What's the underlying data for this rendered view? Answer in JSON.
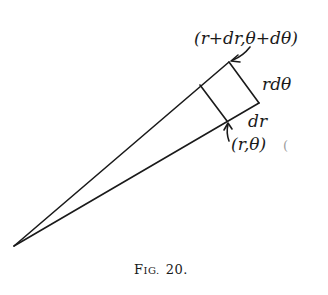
{
  "diagram": {
    "labels": {
      "outer_point": "(r+dr,θ+dθ)",
      "arc_length": "rdθ",
      "radial_length": "dr",
      "inner_point": "(r,θ)",
      "stray_mark": "("
    },
    "caption": {
      "first_letter": "F",
      "rest": "IG.",
      "number": "20."
    },
    "geometry": {
      "apex": [
        14,
        246
      ],
      "upper_ray_end": [
        229,
        62
      ],
      "lower_ray_end": [
        259,
        103
      ],
      "inner_upper_corner": [
        200,
        85
      ],
      "inner_lower_corner": [
        227,
        121
      ]
    },
    "colors": {
      "ink": "#1a1a1a",
      "background": "#ffffff"
    }
  }
}
